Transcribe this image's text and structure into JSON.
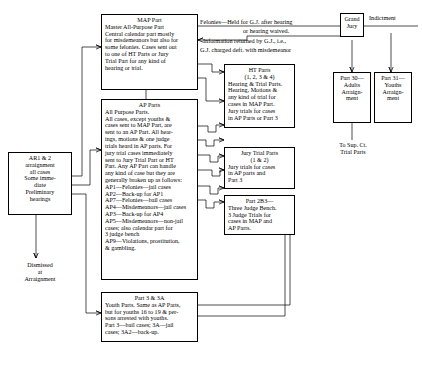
{
  "diagram": {
    "boxes": {
      "ar": {
        "name": "arraignment-box",
        "lines": "AR1 & 2\narraignment\nall cases\nSome imme-\ndiate\nPreliminary\nhearings"
      },
      "dismissed": {
        "name": "dismissed-label",
        "lines": "Dismissed\nat\nArraignment"
      },
      "map": {
        "title": "MAP Part",
        "body": "Master All-Purpose Part\nCentral calendar part mostly\nfor misdemeanors but also for\nsome felonies. Cases sent out\nto one of HT Parts or Jury\nTrial Part for any kind of\nhearing or trial."
      },
      "ap": {
        "title": "AP Parts",
        "body": "All Purpose Parts.\nAll cases, except youths &\ncases sent to MAP Part, are\nsent to an AP Part.  All hear-\nings, motions & one judge\ntrials heard in AP parts. For\njury trial cases immediately\nsent to Jury Trial Part or HT\nPart. Any AP Part can handle\nany kind of case but they are\ngenerally broken up as follows:\nAP1—Felonies—jail cases\nAP2—Back-up for AP1\nAP7—Felonies—bail cases\nAP4—Misdemeanors—jail cases\nAP3—Back-up for AP4\nAP5—Misdemeanors—non-jail\n    cases; also calendar part for\n    3 judge bench\nAP9—Violations, prostitution,\n    & gambling."
      },
      "part3": {
        "title": "Part 3 & 3A",
        "body": "Youth Parts. Same as AP Parts,\nbut for youths 16 to 19 & per-\nsons arrested with youths.\nPart 3—bail cases; 3A—jail\ncases; 3A2—back-up."
      },
      "ht": {
        "title": "HT Parts",
        "subtitle": "(1, 2, 3 & 4)",
        "body": "Hearing & Trial Parts.\nHearing, Motions &\nany kind of trial for\ncases in MAP Part.\nJury trials for cases\nin AP Parts or Part 3"
      },
      "jury_trial": {
        "title": "Jury Trial Parts",
        "subtitle": "(1 & 2)",
        "body": "Jury trials for cases\nin AP parts and\nPart 3"
      },
      "part2b3": {
        "title": "Part 2B3—",
        "body": "Three Judge Bench.\n3 Judge Trials for\ncases in MAP and\nAP Parts."
      },
      "grand_jury": {
        "lines": "Grand\nJury"
      },
      "part30": {
        "lines": "Part 30—\nAdults\nArraign-\nment"
      },
      "part31": {
        "lines": "Part 31—\nYouths\nArraign-\nment"
      },
      "sup_ct": {
        "lines": "To Sup. Ct.\nTrial Parts"
      }
    },
    "edge_labels": {
      "felonies": "Felonies—Held for G.J. after hearing",
      "felonies2": "or hearing waived.",
      "information": "Information returned by G.J., i.e.,",
      "information2": "G.J. charged deft. with misdemeanor",
      "indictment": "Indictment"
    }
  }
}
